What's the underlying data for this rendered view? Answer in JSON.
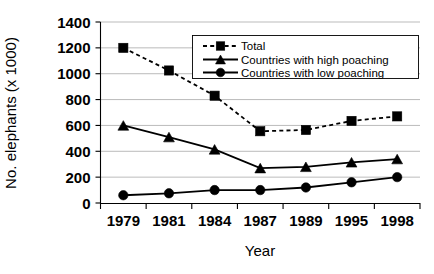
{
  "chart_data": {
    "type": "line",
    "title": "",
    "xlabel": "Year",
    "ylabel": "No. elephants (x 1000)",
    "categories": [
      "1979",
      "1981",
      "1984",
      "1987",
      "1989",
      "1995",
      "1998"
    ],
    "ylim": [
      0,
      1400
    ],
    "ytick_step": 200,
    "yticks": [
      "0",
      "200",
      "400",
      "600",
      "800",
      "1000",
      "1200",
      "1400"
    ],
    "grid": "horizontal",
    "legend_position": "top-right-inside",
    "series": [
      {
        "name": "Total",
        "marker": "square",
        "line_style": "dashed",
        "color": "#000000",
        "values": [
          1200,
          1025,
          830,
          555,
          565,
          635,
          670
        ]
      },
      {
        "name": "Countries with high poaching",
        "marker": "triangle",
        "line_style": "solid",
        "color": "#000000",
        "values": [
          600,
          510,
          415,
          270,
          280,
          315,
          340
        ]
      },
      {
        "name": "Countries with low poaching",
        "marker": "circle",
        "line_style": "solid",
        "color": "#000000",
        "values": [
          60,
          75,
          100,
          100,
          120,
          160,
          200
        ]
      }
    ]
  },
  "legend": {
    "entries": [
      {
        "label": "Total"
      },
      {
        "label": "Countries with high poaching"
      },
      {
        "label": "Countries with low poaching"
      }
    ]
  },
  "axes": {
    "x_title": "Year",
    "y_title": "No. elephants (x 1000)"
  }
}
